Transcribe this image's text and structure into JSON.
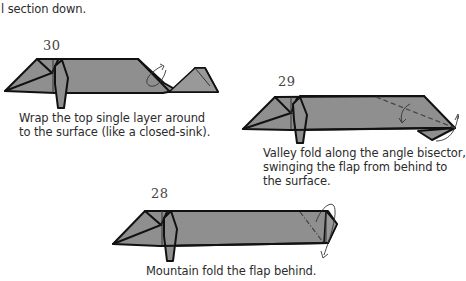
{
  "page": {
    "top_fragment": "l section down."
  },
  "steps": [
    {
      "number": "30",
      "instruction_lines": [
        "Wrap the top single layer around",
        "to the surface (like a closed-sink)."
      ]
    },
    {
      "number": "29",
      "instruction_lines": [
        "Valley fold along the angle bisector,",
        "swinging the flap from behind to",
        "the surface."
      ]
    },
    {
      "number": "28",
      "instruction_lines": [
        "Mountain fold the flap behind."
      ]
    }
  ],
  "colors": {
    "paper_fill": "#8f8f8f",
    "line": "#111111",
    "text": "#2b2b2b",
    "background": "#ffffff"
  }
}
